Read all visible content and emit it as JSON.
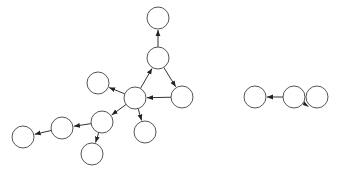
{
  "diagram": {
    "type": "directed-graph",
    "style": {
      "node_fill": "#ffffff",
      "node_stroke": "#555555",
      "edge_color": "#333333",
      "node_radius": 11
    },
    "nodes": [
      {
        "id": "n_top",
        "x": 158,
        "y": 18
      },
      {
        "id": "n_mid",
        "x": 158,
        "y": 58
      },
      {
        "id": "n_right",
        "x": 182,
        "y": 97
      },
      {
        "id": "n_center",
        "x": 135,
        "y": 98
      },
      {
        "id": "n_left_upper",
        "x": 98,
        "y": 83
      },
      {
        "id": "n_lower_mid",
        "x": 102,
        "y": 122
      },
      {
        "id": "n_bottom_center",
        "x": 145,
        "y": 132
      },
      {
        "id": "n_left2",
        "x": 62,
        "y": 128
      },
      {
        "id": "n_far_left",
        "x": 23,
        "y": 137
      },
      {
        "id": "n_bottom",
        "x": 92,
        "y": 154
      },
      {
        "id": "r_left",
        "x": 255,
        "y": 97
      },
      {
        "id": "r_mid",
        "x": 294,
        "y": 97
      }
    ],
    "edges": [
      {
        "from": "n_mid",
        "to": "n_top"
      },
      {
        "from": "n_mid",
        "to": "n_right"
      },
      {
        "from": "n_right",
        "to": "n_center"
      },
      {
        "from": "n_center",
        "to": "n_mid"
      },
      {
        "from": "n_center",
        "to": "n_left_upper"
      },
      {
        "from": "n_center",
        "to": "n_lower_mid"
      },
      {
        "from": "n_center",
        "to": "n_bottom_center"
      },
      {
        "from": "n_lower_mid",
        "to": "n_left2"
      },
      {
        "from": "n_lower_mid",
        "to": "n_bottom"
      },
      {
        "from": "n_left2",
        "to": "n_far_left"
      },
      {
        "from": "r_mid",
        "to": "r_left"
      }
    ],
    "self_loops": [
      {
        "node": "r_mid",
        "cx": 317,
        "cy": 97,
        "r": 11,
        "arrow_x": 308,
        "arrow_y": 106
      }
    ]
  }
}
